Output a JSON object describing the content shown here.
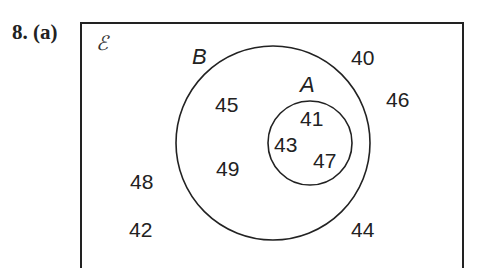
{
  "question": {
    "number": "8.",
    "part": "(a)"
  },
  "diagram": {
    "universal_symbol": "ℰ",
    "sets": [
      {
        "name": "B",
        "label": "B"
      },
      {
        "name": "A",
        "label": "A",
        "subset_of": "B"
      }
    ],
    "regions": {
      "A": [
        "41",
        "43",
        "47"
      ],
      "B_only": [
        "45",
        "49"
      ],
      "outside": [
        "40",
        "46",
        "48",
        "42",
        "44"
      ]
    },
    "numbers": {
      "n40": "40",
      "n41": "41",
      "n42": "42",
      "n43": "43",
      "n44": "44",
      "n45": "45",
      "n46": "46",
      "n47": "47",
      "n48": "48",
      "n49": "49"
    }
  }
}
